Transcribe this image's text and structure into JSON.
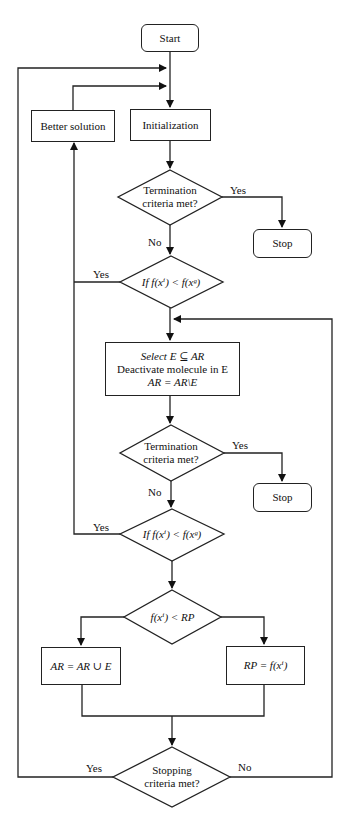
{
  "diagram": {
    "type": "flowchart",
    "nodes": {
      "start": {
        "label": "Start"
      },
      "better_solution": {
        "label": "Better solution"
      },
      "initialization": {
        "label": "Initialization"
      },
      "termination1": {
        "line1": "Termination",
        "line2": "criteria met?"
      },
      "stop1": {
        "label": "Stop"
      },
      "compare1": {
        "label": "If f(xⁱ) < f(xᵍ)"
      },
      "select": {
        "line1": "Select E ⊆ AR",
        "line2": "Deactivate molecule in E",
        "line3": "AR = AR\\E"
      },
      "termination2": {
        "line1": "Termination",
        "line2": "criteria met?"
      },
      "stop2": {
        "label": "Stop"
      },
      "compare2": {
        "label": "If f(xⁱ) < f(xᵍ)"
      },
      "compare_rp": {
        "label": "f(xⁱ) < RP"
      },
      "ar_union": {
        "label": "AR = AR ∪ E"
      },
      "rp_assign": {
        "label": "RP = f(xⁱ)"
      },
      "stopping": {
        "line1": "Stopping",
        "line2": "criteria met?"
      }
    },
    "edge_labels": {
      "t1_yes": "Yes",
      "t1_no": "No",
      "c1_yes": "Yes",
      "t2_yes": "Yes",
      "t2_no": "No",
      "c2_yes": "Yes",
      "stop_yes": "Yes",
      "stop_no": "No"
    }
  }
}
